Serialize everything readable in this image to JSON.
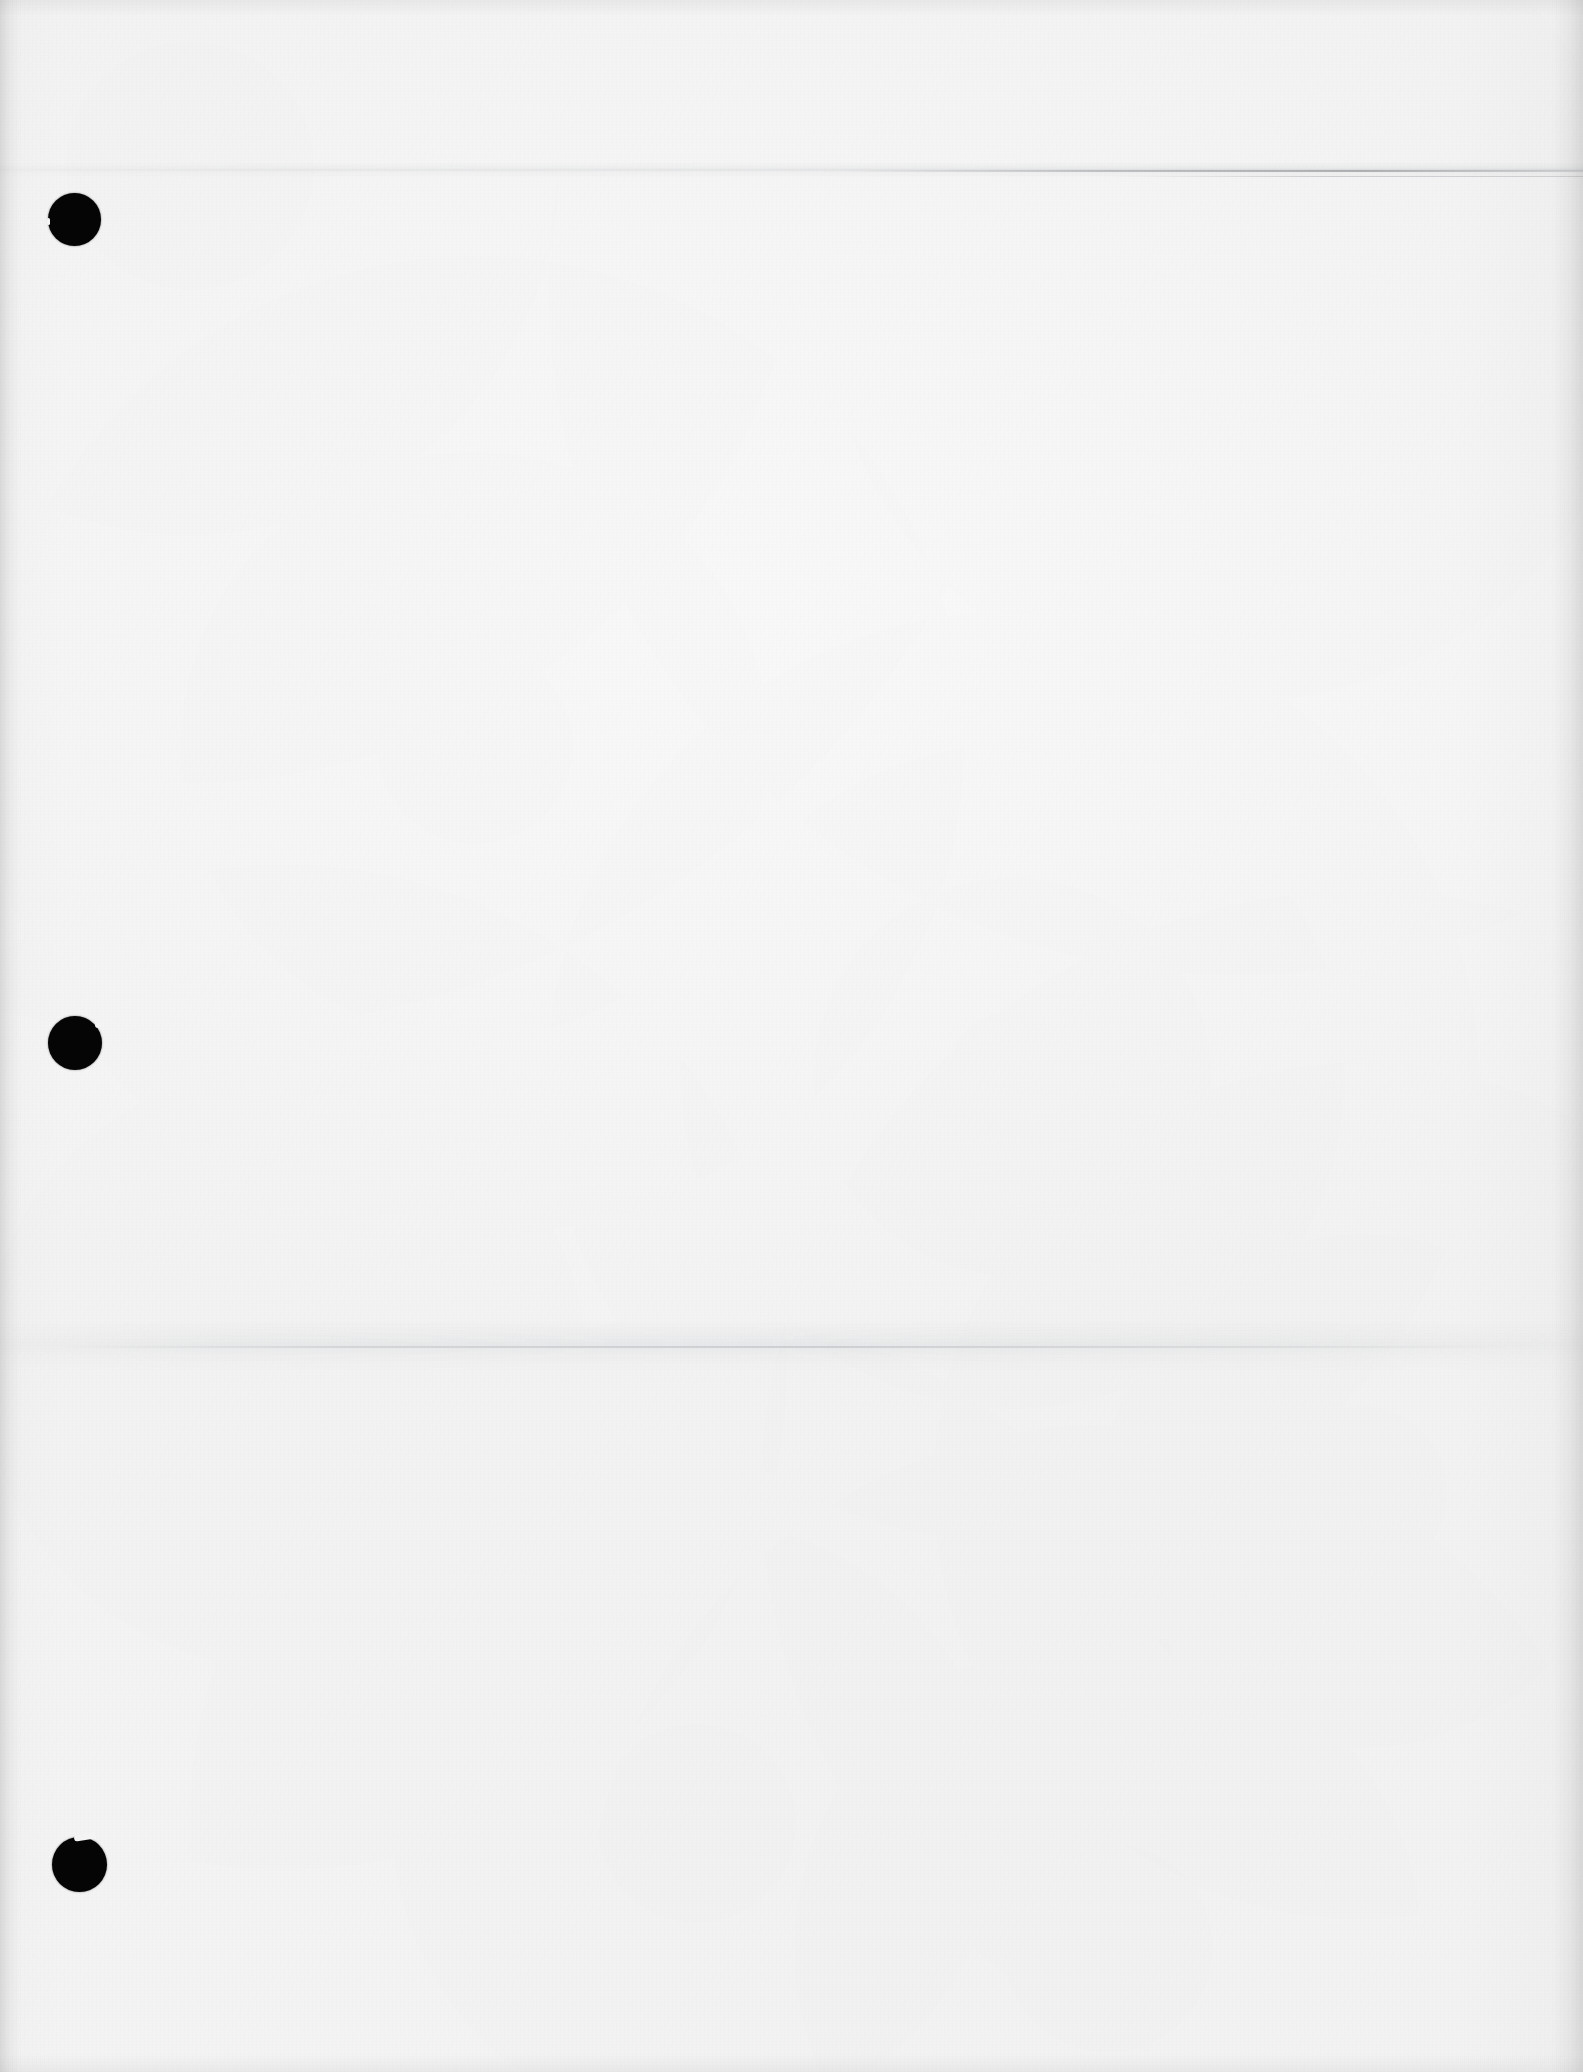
{
  "document": {
    "kind": "scanned-page",
    "page_label": "",
    "orientation": "portrait",
    "width_px": 1583,
    "height_px": 2072,
    "content_text": "",
    "is_blank": "true",
    "paper_color": "#fbfbfb",
    "paper_shade_light": "#fdfdfd",
    "paper_shade_dark": "#f2f2f2",
    "ink_color": "#050505",
    "crease_color": "#a0a4aa"
  },
  "artifacts": {
    "punch_holes_label": "three-ring binder punch holes",
    "punch_holes": [
      {
        "name": "top",
        "cx": 74,
        "cy": 219,
        "d": 53
      },
      {
        "name": "middle",
        "cx": 75,
        "cy": 1043,
        "d": 54
      },
      {
        "name": "bottom",
        "cx": 80,
        "cy": 1864,
        "d": 55
      }
    ],
    "creases": [
      {
        "name": "upper-fold",
        "y": 170,
        "emphasis": "right"
      },
      {
        "name": "lower-fold",
        "y": 1346,
        "emphasis": "center-left"
      }
    ],
    "edges": {
      "left_shadow": "true",
      "right_shadow": "true",
      "top_shadow": "true",
      "bottom_shadow": "true"
    }
  }
}
